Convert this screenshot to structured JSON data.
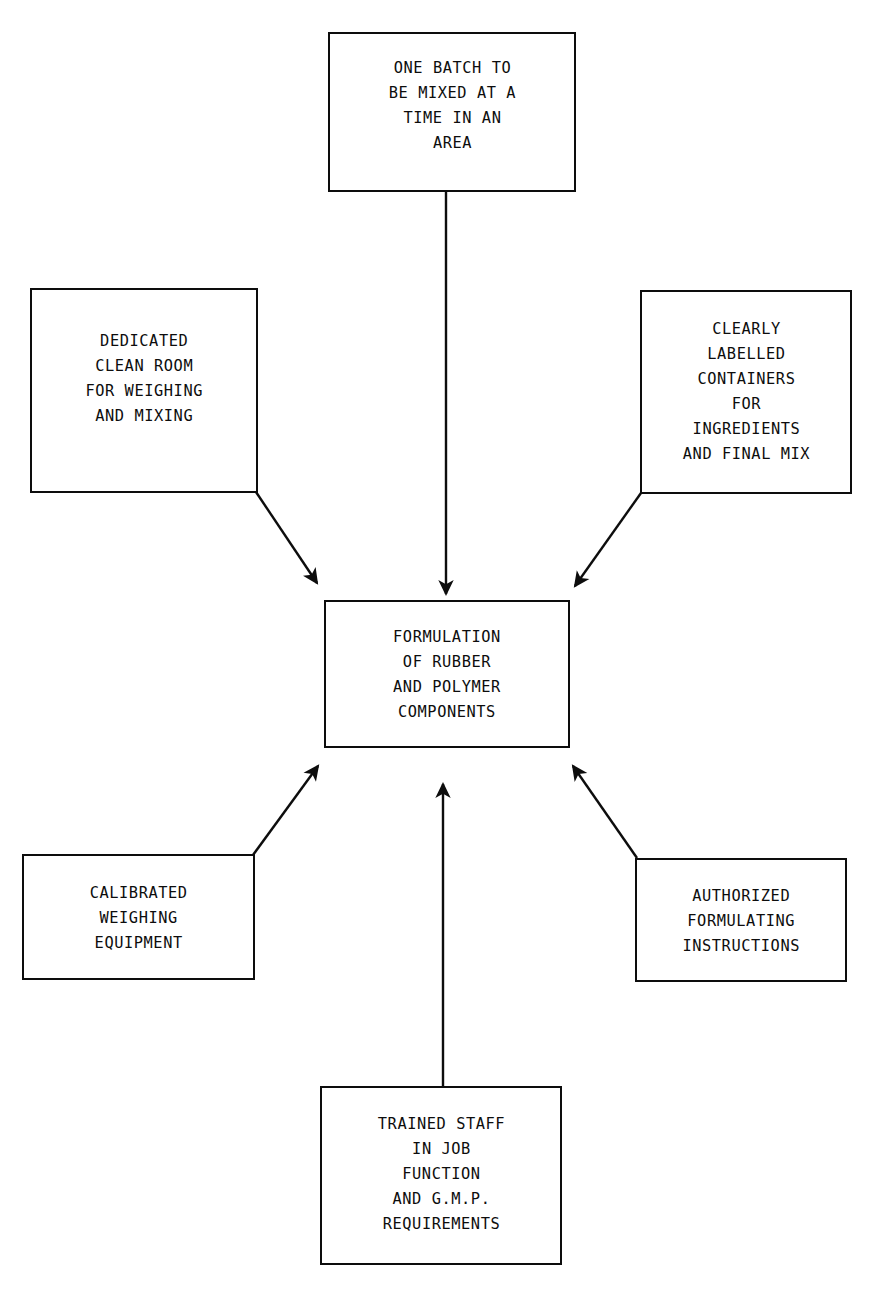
{
  "diagram": {
    "type": "hub-and-spoke flow diagram",
    "orientation": "six peripheral boxes feeding into one central box",
    "background_color": "#ffffff",
    "line_color": "#0d0d0d",
    "text_color": "#0d0d0d"
  },
  "nodes": {
    "center": {
      "id": "formulation-of-rubber-and-polymer-components",
      "text": "FORMULATION\nOF RUBBER\nAND POLYMER\nCOMPONENTS",
      "role": "central process"
    },
    "top": {
      "id": "one-batch-to-be-mixed-at-a-time-in-an-area",
      "text": "ONE BATCH TO\nBE MIXED AT A\nTIME IN AN\nAREA",
      "role": "input requirement"
    },
    "top_left": {
      "id": "dedicated-clean-room-for-weighing-and-mixing",
      "text": "DEDICATED\nCLEAN ROOM\nFOR WEIGHING\nAND MIXING",
      "role": "input requirement"
    },
    "top_right": {
      "id": "clearly-labelled-containers-for-ingredients-and-final-mix",
      "text": "CLEARLY\nLABELLED\nCONTAINERS\nFOR\nINGREDIENTS\nAND FINAL MIX",
      "role": "input requirement"
    },
    "bottom_left": {
      "id": "calibrated-weighing-equipment",
      "text": "CALIBRATED\nWEIGHING\nEQUIPMENT",
      "role": "input requirement"
    },
    "bottom_right": {
      "id": "authorized-formulating-instructions",
      "text": "AUTHORIZED\nFORMULATING\nINSTRUCTIONS",
      "role": "input requirement"
    },
    "bottom": {
      "id": "trained-staff-in-job-function-and-gmp-requirements",
      "text": "TRAINED STAFF\nIN JOB\nFUNCTION\nAND G.M.P.\nREQUIREMENTS",
      "role": "input requirement"
    }
  },
  "edges": [
    {
      "id": "edge-top-to-center",
      "from": "top",
      "to": "center",
      "style": "straight vertical arrow pointing down"
    },
    {
      "id": "edge-topleft-to-center",
      "from": "top_left",
      "to": "center",
      "style": "diagonal arrow pointing down-right"
    },
    {
      "id": "edge-topright-to-center",
      "from": "top_right",
      "to": "center",
      "style": "diagonal arrow pointing down-left"
    },
    {
      "id": "edge-bottomleft-to-center",
      "from": "bottom_left",
      "to": "center",
      "style": "diagonal arrow pointing up-right"
    },
    {
      "id": "edge-bottomright-to-center",
      "from": "bottom_right",
      "to": "center",
      "style": "diagonal arrow pointing up-left"
    },
    {
      "id": "edge-bottom-to-center",
      "from": "bottom",
      "to": "center",
      "style": "straight vertical arrow pointing up"
    }
  ]
}
